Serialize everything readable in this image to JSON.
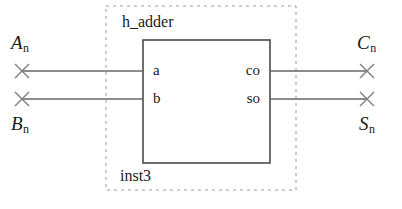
{
  "diagram": {
    "type": "schematic",
    "component": {
      "block_label": "h_adder",
      "instance_label": "inst3",
      "ports": {
        "inputs": [
          {
            "name": "a"
          },
          {
            "name": "b"
          }
        ],
        "outputs": [
          {
            "name": "co"
          },
          {
            "name": "so"
          }
        ]
      }
    },
    "signals": {
      "inputs": [
        {
          "base": "A",
          "sub": "n"
        },
        {
          "base": "B",
          "sub": "n"
        }
      ],
      "outputs": [
        {
          "base": "C",
          "sub": "n"
        },
        {
          "base": "S",
          "sub": "n"
        }
      ]
    },
    "colors": {
      "line": "#555555",
      "box": "#444444",
      "boundary": "#999999",
      "text": "#1a1a1a",
      "background": "#ffffff"
    }
  }
}
